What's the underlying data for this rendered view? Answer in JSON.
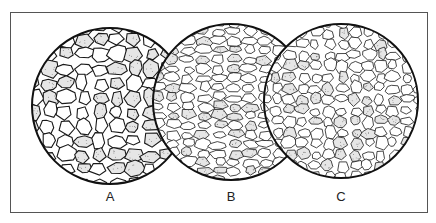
{
  "figure": {
    "panels": [
      {
        "label": "A",
        "cx": 110,
        "cy": 106,
        "r": 78,
        "grain": "coarse",
        "seed": 3,
        "cell": 17
      },
      {
        "label": "B",
        "cx": 231,
        "cy": 102,
        "r": 78,
        "grain": "fine-elongated",
        "seed": 11,
        "cell": 11
      },
      {
        "label": "C",
        "cx": 341,
        "cy": 101,
        "r": 77,
        "grain": "mixed",
        "seed": 23,
        "cell": 13
      }
    ],
    "labels_y": 197,
    "colors": {
      "line": "#1a1a1a",
      "stipple": "#555555",
      "frame": "#555555"
    }
  }
}
